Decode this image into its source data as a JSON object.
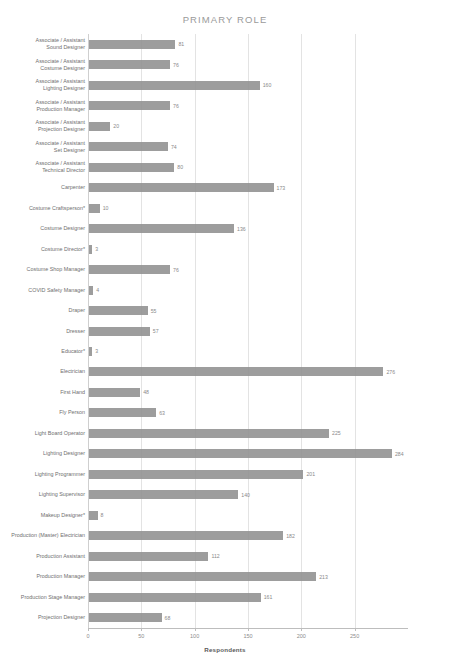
{
  "chart_data": {
    "type": "bar",
    "orientation": "horizontal",
    "title": "PRIMARY ROLE",
    "xlabel": "Respondents",
    "ylabel": "",
    "xlim": [
      0,
      300
    ],
    "xticks": [
      0,
      50,
      100,
      150,
      200,
      250
    ],
    "grid": true,
    "legend": "none",
    "bar_color": "#8f8f8f",
    "categories": [
      "Associate / Assistant\nSound Designer",
      "Associate / Assistant\nCostume Designer",
      "Associate / Assistant\nLighting Designer",
      "Associate / Assistant\nProduction Manager",
      "Associate / Assistant\nProjection Designer",
      "Associate / Assistant\nSet Designer",
      "Associate / Assistant\nTechnical Director",
      "Carpenter",
      "Costume Craftsperson*",
      "Costume Designer",
      "Costume Director*",
      "Costume Shop Manager",
      "COVID Safety Manager",
      "Draper",
      "Dresser",
      "Educator*",
      "Electrician",
      "First Hand",
      "Fly Person",
      "Light Board Operator",
      "Lighting Designer",
      "Lighting Programmer",
      "Lighting Supervisor",
      "Makeup Designer*",
      "Production (Master) Electrician",
      "Production Assistant",
      "Production Manager",
      "Production Stage Manager",
      "Projection Designer"
    ],
    "values": [
      81,
      76,
      160,
      76,
      20,
      74,
      80,
      173,
      10,
      136,
      3,
      76,
      4,
      55,
      57,
      3,
      276,
      48,
      63,
      225,
      284,
      201,
      140,
      8,
      182,
      112,
      213,
      161,
      68
    ]
  }
}
